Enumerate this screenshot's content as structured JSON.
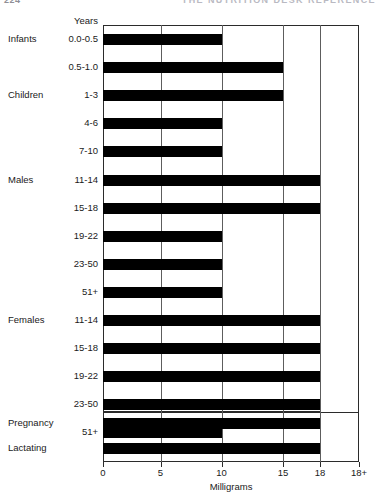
{
  "page": {
    "folio": "224",
    "running_head": "THE NUTRITION DESK REFERENCE"
  },
  "chart_data": {
    "type": "bar",
    "orientation": "horizontal",
    "title": "",
    "xlabel": "Milligrams",
    "ylabel": "Years",
    "years_caption": "Years",
    "xlim": [
      0,
      18.8
    ],
    "grid": true,
    "legend": false,
    "tick_values": [
      0,
      5,
      10,
      15,
      18,
      18.8
    ],
    "tick_labels": [
      "0",
      "5",
      "10",
      "15",
      "18",
      "18+"
    ],
    "categories": [
      "0.0-0.5",
      "0.5-1.0",
      "1-3",
      "4-6",
      "7-10",
      "11-14",
      "15-18",
      "19-22",
      "23-50",
      "51+",
      "11-14",
      "15-18",
      "19-22",
      "23-50",
      "51+",
      "Pregnancy",
      "Lactating"
    ],
    "values": [
      10,
      15,
      15,
      10,
      10,
      18,
      18,
      10,
      10,
      10,
      18,
      18,
      18,
      18,
      10,
      18,
      18
    ],
    "groups": [
      {
        "label": "Infants",
        "start_index": 0
      },
      {
        "label": "Children",
        "start_index": 2
      },
      {
        "label": "Males",
        "start_index": 5
      },
      {
        "label": "Females",
        "start_index": 10
      }
    ],
    "rows": [
      {
        "group": "Infants",
        "age": "0.0-0.5",
        "value": 10
      },
      {
        "group": "",
        "age": "0.5-1.0",
        "value": 15
      },
      {
        "group": "Children",
        "age": "1-3",
        "value": 15
      },
      {
        "group": "",
        "age": "4-6",
        "value": 10
      },
      {
        "group": "",
        "age": "7-10",
        "value": 10
      },
      {
        "group": "Males",
        "age": "11-14",
        "value": 18
      },
      {
        "group": "",
        "age": "15-18",
        "value": 18
      },
      {
        "group": "",
        "age": "19-22",
        "value": 10
      },
      {
        "group": "",
        "age": "23-50",
        "value": 10
      },
      {
        "group": "",
        "age": "51+",
        "value": 10
      },
      {
        "group": "Females",
        "age": "11-14",
        "value": 18
      },
      {
        "group": "",
        "age": "15-18",
        "value": 18
      },
      {
        "group": "",
        "age": "19-22",
        "value": 18
      },
      {
        "group": "",
        "age": "23-50",
        "value": 18
      },
      {
        "group": "",
        "age": "51+",
        "value": 10
      },
      {
        "group": "Pregnancy",
        "age": "",
        "value": 18
      },
      {
        "group": "Lactating",
        "age": "",
        "value": 18
      }
    ]
  }
}
